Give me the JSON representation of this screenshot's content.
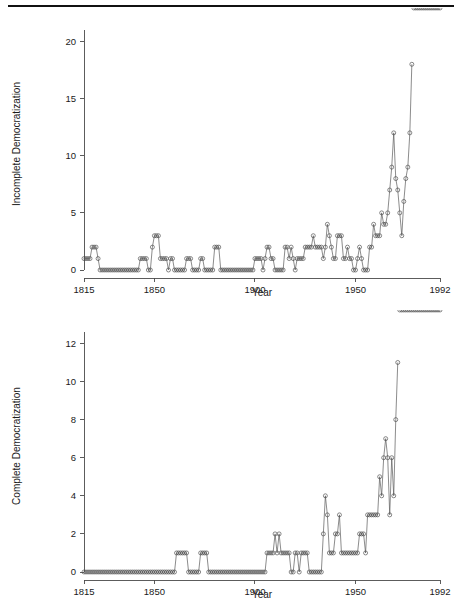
{
  "page": {
    "background_color": "#ffffff",
    "rule_color": "#111111",
    "has_top_rule": true
  },
  "chart_data": [
    {
      "id": "incomplete-democratization",
      "type": "line",
      "title": "",
      "xlabel": "Year",
      "ylabel": "Incomplete Democratization",
      "xlim": [
        1815,
        1992
      ],
      "ylim": [
        0,
        21
      ],
      "xticks": [
        1815,
        1850,
        1900,
        1950,
        1992
      ],
      "xtick_labels": [
        "1815",
        "1850",
        "1900",
        "1950",
        "1992"
      ],
      "yticks": [
        0,
        5,
        10,
        15,
        20
      ],
      "ytick_labels": [
        "0",
        "5",
        "10",
        "15",
        "20"
      ],
      "grid": false,
      "legend": false,
      "marker": "open-circle",
      "line_color": "#5a5a5a",
      "marker_color": "#4a4a4a",
      "x": [
        1815,
        1816,
        1817,
        1818,
        1819,
        1820,
        1821,
        1822,
        1823,
        1824,
        1825,
        1826,
        1827,
        1828,
        1829,
        1830,
        1831,
        1832,
        1833,
        1834,
        1835,
        1836,
        1837,
        1838,
        1839,
        1840,
        1841,
        1842,
        1843,
        1844,
        1845,
        1846,
        1847,
        1848,
        1849,
        1850,
        1851,
        1852,
        1853,
        1854,
        1855,
        1856,
        1857,
        1858,
        1859,
        1860,
        1861,
        1862,
        1863,
        1864,
        1865,
        1866,
        1867,
        1868,
        1869,
        1870,
        1871,
        1872,
        1873,
        1874,
        1875,
        1876,
        1877,
        1878,
        1879,
        1880,
        1881,
        1882,
        1883,
        1884,
        1885,
        1886,
        1887,
        1888,
        1889,
        1890,
        1891,
        1892,
        1893,
        1894,
        1895,
        1896,
        1897,
        1898,
        1899,
        1900,
        1901,
        1902,
        1903,
        1904,
        1905,
        1906,
        1907,
        1908,
        1909,
        1910,
        1911,
        1912,
        1913,
        1914,
        1915,
        1916,
        1917,
        1918,
        1919,
        1920,
        1921,
        1922,
        1923,
        1924,
        1925,
        1926,
        1927,
        1928,
        1929,
        1930,
        1931,
        1932,
        1933,
        1934,
        1935,
        1936,
        1937,
        1938,
        1939,
        1940,
        1941,
        1942,
        1943,
        1944,
        1945,
        1946,
        1947,
        1948,
        1949,
        1950,
        1951,
        1952,
        1953,
        1954,
        1955,
        1956,
        1957,
        1958,
        1959,
        1960,
        1961,
        1962,
        1963,
        1964,
        1965,
        1966,
        1967,
        1968,
        1969,
        1970,
        1971,
        1972,
        1973,
        1974,
        1975,
        1976,
        1977,
        1978,
        1979,
        1980,
        1981,
        1982,
        1983,
        1984,
        1985,
        1986,
        1987,
        1988,
        1989,
        1990,
        1991,
        1992
      ],
      "y": [
        1,
        1,
        1,
        1,
        2,
        2,
        2,
        1,
        0,
        0,
        0,
        0,
        0,
        0,
        0,
        0,
        0,
        0,
        0,
        0,
        0,
        0,
        0,
        0,
        0,
        0,
        0,
        0,
        1,
        1,
        1,
        1,
        0,
        0,
        2,
        3,
        3,
        3,
        1,
        1,
        1,
        1,
        0,
        1,
        1,
        0,
        0,
        0,
        0,
        0,
        0,
        1,
        1,
        1,
        0,
        0,
        0,
        0,
        1,
        1,
        0,
        0,
        0,
        0,
        0,
        2,
        2,
        2,
        0,
        0,
        0,
        0,
        0,
        0,
        0,
        0,
        0,
        0,
        0,
        0,
        0,
        0,
        0,
        0,
        0,
        1,
        1,
        1,
        1,
        0,
        1,
        2,
        2,
        1,
        1,
        0,
        0,
        0,
        0,
        0,
        2,
        2,
        1,
        2,
        1,
        0,
        1,
        1,
        1,
        1,
        2,
        2,
        2,
        2,
        3,
        2,
        2,
        2,
        2,
        1,
        2,
        4,
        3,
        2,
        1,
        1,
        3,
        3,
        3,
        1,
        1,
        2,
        1,
        1,
        0,
        0,
        1,
        2,
        1,
        0,
        0,
        0,
        2,
        2,
        4,
        3,
        3,
        3,
        5,
        4,
        4,
        5,
        7,
        9,
        12,
        8,
        7,
        5,
        3,
        6,
        8,
        9,
        12,
        18
      ]
    },
    {
      "id": "complete-democratization",
      "type": "line",
      "title": "",
      "xlabel": "Year",
      "ylabel": "Complete Democratization",
      "xlim": [
        1815,
        1992
      ],
      "ylim": [
        0,
        12.6
      ],
      "xticks": [
        1815,
        1850,
        1900,
        1950,
        1992
      ],
      "xtick_labels": [
        "1815",
        "1850",
        "1900",
        "1950",
        "1992"
      ],
      "yticks": [
        0,
        2,
        4,
        6,
        8,
        10,
        12
      ],
      "ytick_labels": [
        "0",
        "2",
        "4",
        "6",
        "8",
        "10",
        "12"
      ],
      "grid": false,
      "legend": false,
      "marker": "open-circle",
      "line_color": "#5a5a5a",
      "marker_color": "#4a4a4a",
      "x": [
        1815,
        1816,
        1817,
        1818,
        1819,
        1820,
        1821,
        1822,
        1823,
        1824,
        1825,
        1826,
        1827,
        1828,
        1829,
        1830,
        1831,
        1832,
        1833,
        1834,
        1835,
        1836,
        1837,
        1838,
        1839,
        1840,
        1841,
        1842,
        1843,
        1844,
        1845,
        1846,
        1847,
        1848,
        1849,
        1850,
        1851,
        1852,
        1853,
        1854,
        1855,
        1856,
        1857,
        1858,
        1859,
        1860,
        1861,
        1862,
        1863,
        1864,
        1865,
        1866,
        1867,
        1868,
        1869,
        1870,
        1871,
        1872,
        1873,
        1874,
        1875,
        1876,
        1877,
        1878,
        1879,
        1880,
        1881,
        1882,
        1883,
        1884,
        1885,
        1886,
        1887,
        1888,
        1889,
        1890,
        1891,
        1892,
        1893,
        1894,
        1895,
        1896,
        1897,
        1898,
        1899,
        1900,
        1901,
        1902,
        1903,
        1904,
        1905,
        1906,
        1907,
        1908,
        1909,
        1910,
        1911,
        1912,
        1913,
        1914,
        1915,
        1916,
        1917,
        1918,
        1919,
        1920,
        1921,
        1922,
        1923,
        1924,
        1925,
        1926,
        1927,
        1928,
        1929,
        1930,
        1931,
        1932,
        1933,
        1934,
        1935,
        1936,
        1937,
        1938,
        1939,
        1940,
        1941,
        1942,
        1943,
        1944,
        1945,
        1946,
        1947,
        1948,
        1949,
        1950,
        1951,
        1952,
        1953,
        1954,
        1955,
        1956,
        1957,
        1958,
        1959,
        1960,
        1961,
        1962,
        1963,
        1964,
        1965,
        1966,
        1967,
        1968,
        1969,
        1970,
        1971,
        1972,
        1973,
        1974,
        1975,
        1976,
        1977,
        1978,
        1979,
        1980,
        1981,
        1982,
        1983,
        1984,
        1985,
        1986,
        1987,
        1988,
        1989,
        1990,
        1991,
        1992
      ],
      "y": [
        0,
        0,
        0,
        0,
        0,
        0,
        0,
        0,
        0,
        0,
        0,
        0,
        0,
        0,
        0,
        0,
        0,
        0,
        0,
        0,
        0,
        0,
        0,
        0,
        0,
        0,
        0,
        0,
        0,
        0,
        0,
        0,
        0,
        0,
        0,
        0,
        0,
        0,
        0,
        0,
        0,
        0,
        0,
        0,
        0,
        0,
        1,
        1,
        1,
        1,
        1,
        1,
        0,
        0,
        0,
        0,
        0,
        0,
        1,
        1,
        1,
        1,
        0,
        0,
        0,
        0,
        0,
        0,
        0,
        0,
        0,
        0,
        0,
        0,
        0,
        0,
        0,
        0,
        0,
        0,
        0,
        0,
        0,
        0,
        0,
        0,
        0,
        0,
        0,
        0,
        0,
        1,
        1,
        1,
        1,
        2,
        1,
        2,
        1,
        1,
        1,
        1,
        1,
        0,
        0,
        1,
        1,
        0,
        1,
        1,
        1,
        1,
        0,
        0,
        0,
        0,
        0,
        0,
        0,
        2,
        4,
        3,
        1,
        1,
        1,
        2,
        2,
        3,
        1,
        1,
        1,
        1,
        1,
        1,
        1,
        1,
        1,
        2,
        2,
        2,
        1,
        3,
        3,
        3,
        3,
        3,
        3,
        5,
        4,
        6,
        7,
        6,
        3,
        6,
        4,
        8,
        11
      ]
    }
  ],
  "figures": [
    {
      "name": "top-panel",
      "ylabel": "Incomplete Democratization",
      "xlabel": "Year"
    },
    {
      "name": "bottom-panel",
      "ylabel": "Complete Democratization",
      "xlabel": "Year"
    }
  ]
}
